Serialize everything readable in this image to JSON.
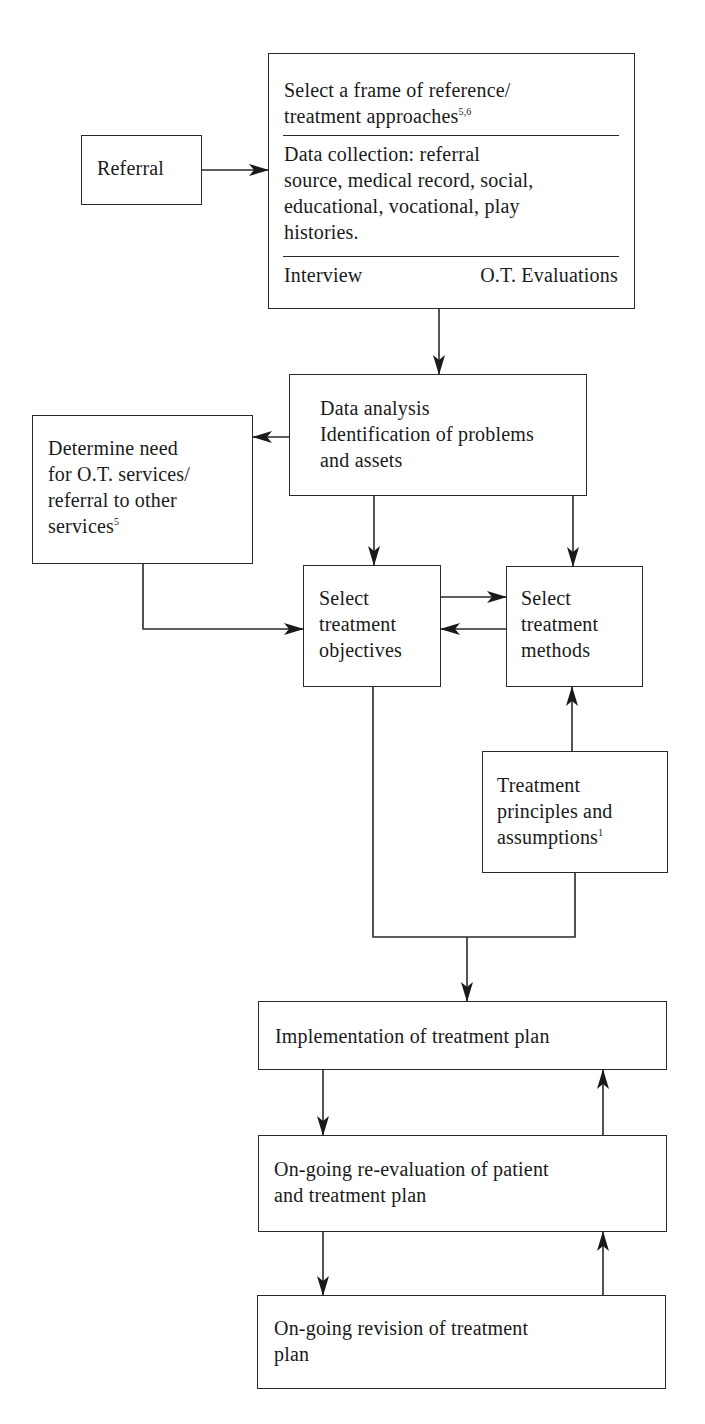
{
  "diagram": {
    "type": "flowchart",
    "nodes": {
      "referral": {
        "label": "Referral"
      },
      "frame": {
        "section1_lines": [
          "Select a frame of reference/",
          "treatment approaches"
        ],
        "section1_sup": "5,6",
        "section2_lines": [
          "Data collection: referral",
          "source, medical record, social,",
          "educational, vocational, play",
          "histories."
        ],
        "section3_left": "Interview",
        "section3_right": "O.T. Evaluations"
      },
      "analysis": {
        "lines": [
          "Data analysis",
          "Identification of problems",
          "and assets"
        ]
      },
      "determine": {
        "lines": [
          "Determine need",
          "for O.T. services/",
          "referral to other",
          "services"
        ],
        "sup": "5"
      },
      "objectives": {
        "lines": [
          "Select",
          "treatment",
          "objectives"
        ]
      },
      "methods": {
        "lines": [
          "Select",
          "treatment",
          "methods"
        ]
      },
      "principles": {
        "lines": [
          "Treatment",
          "principles and",
          "assumptions"
        ],
        "sup": "1"
      },
      "implementation": {
        "label": "Implementation of treatment plan"
      },
      "reevaluation": {
        "lines": [
          "On-going re-evaluation of patient",
          "and treatment plan"
        ]
      },
      "revision": {
        "lines": [
          "On-going revision of treatment",
          "plan"
        ]
      }
    },
    "edges": [
      {
        "from": "Referral",
        "to": "Select a frame of reference"
      },
      {
        "from": "Select a frame of reference",
        "to": "Data analysis"
      },
      {
        "from": "Data analysis",
        "to": "Determine need for O.T. services"
      },
      {
        "from": "Data analysis",
        "to": "Select treatment objectives"
      },
      {
        "from": "Data analysis",
        "to": "Select treatment methods"
      },
      {
        "from": "Determine need for O.T. services",
        "to": "Select treatment objectives"
      },
      {
        "from": "Select treatment objectives",
        "to": "Select treatment methods"
      },
      {
        "from": "Select treatment methods",
        "to": "Select treatment objectives"
      },
      {
        "from": "Treatment principles and assumptions",
        "to": "Select treatment methods"
      },
      {
        "from": "Select treatment objectives + Treatment principles",
        "to": "Implementation of treatment plan"
      },
      {
        "from": "Implementation of treatment plan",
        "to": "On-going re-evaluation"
      },
      {
        "from": "On-going re-evaluation",
        "to": "Implementation of treatment plan"
      },
      {
        "from": "On-going re-evaluation",
        "to": "On-going revision of treatment plan"
      },
      {
        "from": "On-going revision of treatment plan",
        "to": "On-going re-evaluation"
      }
    ],
    "colors": {
      "stroke": "#2a2a2a",
      "text": "#1a1a1a",
      "background": "#ffffff"
    }
  }
}
